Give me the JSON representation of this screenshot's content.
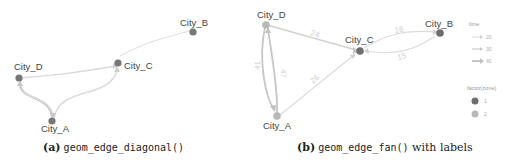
{
  "panels": {
    "a": {
      "caption_tag": "(a)",
      "caption_code": "geom_edge_diagonal()",
      "caption_rest": "",
      "nodes": {
        "city_a": "City_A",
        "city_b": "City_B",
        "city_c": "City_C",
        "city_d": "City_D"
      }
    },
    "b": {
      "caption_tag": "(b)",
      "caption_code": "geom_edge_fan()",
      "caption_rest": " with labels",
      "nodes": {
        "city_a": "City_A",
        "city_b": "City_B",
        "city_c": "City_C",
        "city_d": "City_D"
      },
      "edge_labels": {
        "d_to_c": "24",
        "c_to_b_upper": "16",
        "c_to_b_lower": "15",
        "d_to_a_left": "41",
        "a_to_d_right": "47",
        "a_to_c": "26"
      },
      "legend": {
        "time_title": "time",
        "time_items": [
          "20",
          "30",
          "40"
        ],
        "zone_title": "factor(zone)",
        "zone_items": [
          "1",
          "2"
        ]
      }
    }
  },
  "colors": {
    "zone1_node": "#6e6e6e",
    "zone2_node": "#b5b5b5",
    "edge": "#d6d6d6",
    "edge_dark": "#c4c4c4"
  }
}
